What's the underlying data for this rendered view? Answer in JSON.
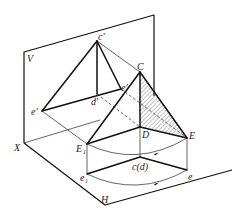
{
  "diagram": {
    "planes": {
      "vertical": "V",
      "horizontal": "H",
      "axis": "X"
    },
    "labels": {
      "V": "V",
      "H": "H",
      "X": "X",
      "c_prime": "c'",
      "d_prime": "d'",
      "e_prime": "e'",
      "e1_prime": "e'",
      "e1_prime_sub": "1",
      "C": "C",
      "D": "D",
      "E": "E",
      "E1": "E",
      "E1_sub": "1",
      "cd": "c(d)",
      "e": "e",
      "e1": "e",
      "e1_sub": "1"
    },
    "points": {
      "c_prime": [
        97,
        41
      ],
      "d_prime": [
        97,
        94
      ],
      "e_prime": [
        121,
        89
      ],
      "e1_prime": [
        42,
        111
      ],
      "C": [
        140,
        72
      ],
      "D": [
        140,
        127
      ],
      "E": [
        187,
        138
      ],
      "E1": [
        87,
        144
      ],
      "cd": [
        140,
        157
      ],
      "e": [
        187,
        170
      ],
      "e1": [
        87,
        174
      ],
      "X": [
        24,
        143
      ]
    },
    "colors": {
      "line": "#111111",
      "background": "#ffffff",
      "hatch": "#333333"
    }
  }
}
